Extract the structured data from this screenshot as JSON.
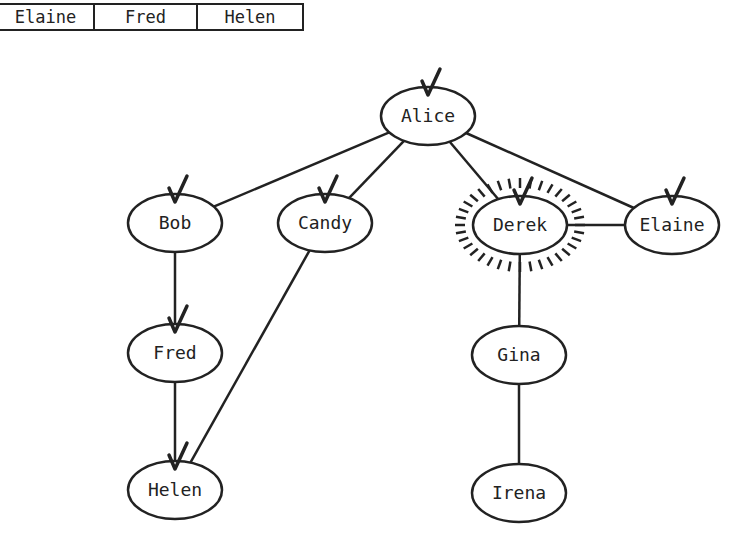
{
  "queue": {
    "cells": [
      {
        "label": "Elaine",
        "width": 97
      },
      {
        "label": "Fred",
        "width": 103
      },
      {
        "label": "Helen",
        "width": 104
      }
    ]
  },
  "graph": {
    "nodes": [
      {
        "id": "alice",
        "label": "Alice",
        "cx": 428,
        "cy": 116,
        "visited": true,
        "current": false
      },
      {
        "id": "bob",
        "label": "Bob",
        "cx": 175,
        "cy": 223,
        "visited": true,
        "current": false
      },
      {
        "id": "candy",
        "label": "Candy",
        "cx": 325,
        "cy": 223,
        "visited": true,
        "current": false
      },
      {
        "id": "derek",
        "label": "Derek",
        "cx": 520,
        "cy": 225,
        "visited": true,
        "current": true
      },
      {
        "id": "elaine",
        "label": "Elaine",
        "cx": 672,
        "cy": 225,
        "visited": true,
        "current": false
      },
      {
        "id": "fred",
        "label": "Fred",
        "cx": 175,
        "cy": 353,
        "visited": true,
        "current": false
      },
      {
        "id": "helen",
        "label": "Helen",
        "cx": 175,
        "cy": 490,
        "visited": true,
        "current": false
      },
      {
        "id": "gina",
        "label": "Gina",
        "cx": 519,
        "cy": 355,
        "visited": false,
        "current": false
      },
      {
        "id": "irena",
        "label": "Irena",
        "cx": 519,
        "cy": 493,
        "visited": false,
        "current": false
      }
    ],
    "edges": [
      [
        "alice",
        "bob"
      ],
      [
        "alice",
        "candy"
      ],
      [
        "alice",
        "derek"
      ],
      [
        "alice",
        "elaine"
      ],
      [
        "bob",
        "fred"
      ],
      [
        "fred",
        "helen"
      ],
      [
        "candy",
        "helen"
      ],
      [
        "derek",
        "elaine"
      ],
      [
        "derek",
        "gina"
      ],
      [
        "gina",
        "irena"
      ]
    ],
    "stroke_color": "#222222"
  }
}
